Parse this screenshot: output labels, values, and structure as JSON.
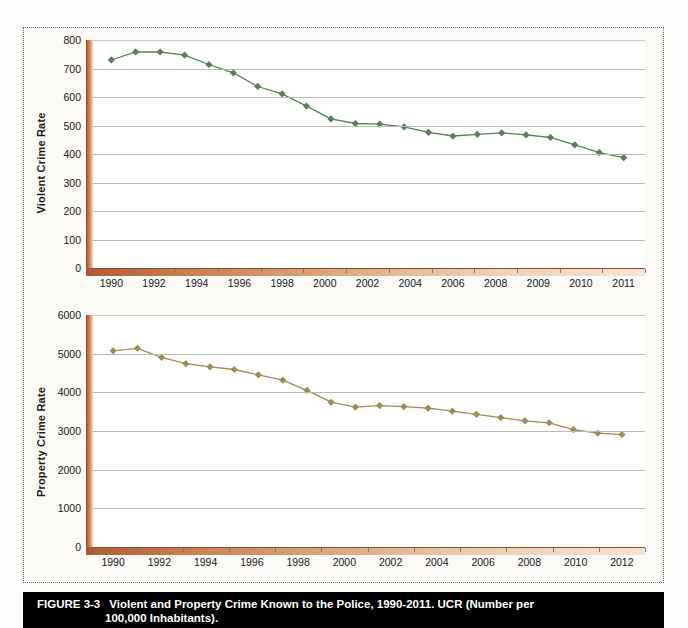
{
  "figure": {
    "number_label": "FIGURE 3-3",
    "caption_line1": "Violent and Property Crime Known to the Police, 1990-2011. UCR (Number per",
    "caption_line2": "100,000 Inhabitants).",
    "caption_bg": "#000000",
    "caption_fg": "#ffffff"
  },
  "chart_data": [
    {
      "id": "violent",
      "type": "line",
      "title": "",
      "xlabel": "",
      "ylabel": "Violent Crime Rate",
      "ylim": [
        0,
        800
      ],
      "yticks": [
        0,
        100,
        200,
        300,
        400,
        500,
        600,
        700,
        800
      ],
      "ytick_labels": [
        "0",
        "100",
        "200",
        "300",
        "400",
        "500",
        "600",
        "700",
        "800"
      ],
      "xtick_labels": [
        "1990",
        "1992",
        "1994",
        "1996",
        "1998",
        "2000",
        "2002",
        "2004",
        "2006",
        "2008",
        "2009",
        "2010",
        "2011"
      ],
      "grid": true,
      "legend": "none",
      "series_color": "#558255",
      "marker": "diamond",
      "x": [
        1990,
        1991,
        1992,
        1993,
        1994,
        1995,
        1996,
        1997,
        1998,
        1999,
        2000,
        2001,
        2002,
        2003,
        2004,
        2005,
        2006,
        2007,
        2008,
        2009,
        2010,
        2011
      ],
      "values": [
        730,
        758,
        758,
        747,
        714,
        685,
        637,
        611,
        568,
        523,
        507,
        505,
        495,
        476,
        463,
        469,
        474,
        467,
        458,
        432,
        405,
        387
      ]
    },
    {
      "id": "property",
      "type": "line",
      "title": "",
      "xlabel": "",
      "ylabel": "Property Crime Rate",
      "ylim": [
        0,
        6000
      ],
      "yticks": [
        0,
        1000,
        2000,
        3000,
        4000,
        5000,
        6000
      ],
      "ytick_labels": [
        "0",
        "1000",
        "2000",
        "3000",
        "4000",
        "5000",
        "6000"
      ],
      "xtick_labels": [
        "1990",
        "1992",
        "1994",
        "1996",
        "1998",
        "2000",
        "2002",
        "2004",
        "2006",
        "2008",
        "2010",
        "2012"
      ],
      "grid": true,
      "legend": "none",
      "series_color": "#a08a55",
      "marker": "diamond",
      "x": [
        1990,
        1991,
        1992,
        1993,
        1994,
        1995,
        1996,
        1997,
        1998,
        1999,
        2000,
        2001,
        2002,
        2003,
        2004,
        2005,
        2006,
        2007,
        2008,
        2009,
        2010,
        2011
      ],
      "values": [
        5073,
        5140,
        4903,
        4740,
        4660,
        4591,
        4451,
        4316,
        4053,
        3744,
        3618,
        3658,
        3631,
        3591,
        3514,
        3432,
        3347,
        3264,
        3213,
        3036,
        2946,
        2908
      ]
    }
  ]
}
